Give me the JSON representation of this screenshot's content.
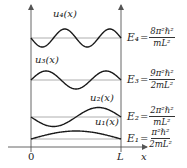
{
  "diagram": {
    "colors": {
      "curve": "#1a1a1a",
      "baseline": "#9a9a9a",
      "axis": "#555555",
      "text": "#222222"
    },
    "axes": {
      "origin_label": "0",
      "wall_label": "L",
      "x_label": "x"
    },
    "levels": [
      {
        "n": 4,
        "wavefunction_label": "u₄(x)",
        "energy_label": "E₄",
        "equals": "=",
        "numerator": "8π²ℏ²",
        "denominator": "mL²"
      },
      {
        "n": 3,
        "wavefunction_label": "u₃(x)",
        "energy_label": "E₃",
        "equals": "=",
        "numerator": "9π²ℏ²",
        "denominator": "2mL²"
      },
      {
        "n": 2,
        "wavefunction_label": "u₂(x)",
        "energy_label": "E₂",
        "equals": "=",
        "numerator": "2π²ℏ²",
        "denominator": "mL²"
      },
      {
        "n": 1,
        "wavefunction_label": "u₁(x)",
        "energy_label": "E₁",
        "equals": "=",
        "numerator": "π²ℏ²",
        "denominator": "2mL²"
      }
    ]
  }
}
